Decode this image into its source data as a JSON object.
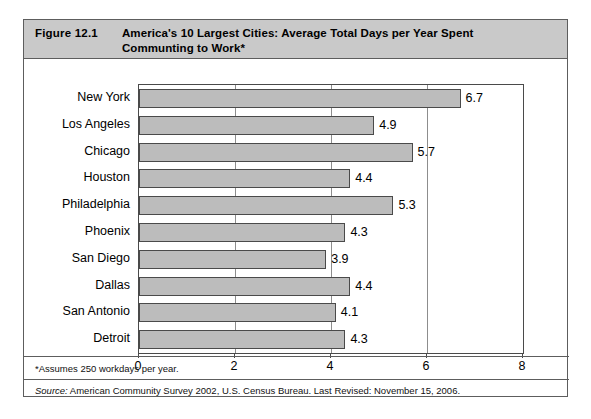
{
  "figure": {
    "number": "Figure 12.1",
    "title": "America's 10 Largest Cities: Average Total Days per Year Spent Communting to Work*",
    "footnote": "*Assumes 250 workdays per year.",
    "source_label": "Source:",
    "source_text": " American Community Survey 2002, U.S. Census Bureau. Last Revised: November 15, 2006."
  },
  "colors": {
    "bar_fill": "#bcbcbc",
    "bar_stroke": "#4a4a4a",
    "header_band": "#c9c9c9",
    "frame": "#5d5d5d",
    "gridline": "#8d8d8d"
  },
  "chart_data": {
    "type": "bar",
    "orientation": "horizontal",
    "title": "America's 10 Largest Cities: Average Total Days per Year Spent Communting to Work*",
    "xlabel": "",
    "ylabel": "",
    "xlim": [
      0,
      8
    ],
    "xticks": [
      0,
      2,
      4,
      6,
      8
    ],
    "xtick_labels": [
      "0",
      "2",
      "4",
      "6",
      "8"
    ],
    "grid": true,
    "gridlines_at": [
      2,
      4,
      6
    ],
    "legend": null,
    "categories": [
      "New York",
      "Los Angeles",
      "Chicago",
      "Houston",
      "Philadelphia",
      "Phoenix",
      "San Diego",
      "Dallas",
      "San Antonio",
      "Detroit"
    ],
    "values": [
      6.7,
      4.9,
      5.7,
      4.4,
      5.3,
      4.3,
      3.9,
      4.4,
      4.1,
      4.3
    ],
    "data_labels": [
      "6.7",
      "4.9",
      "5.7",
      "4.4",
      "5.3",
      "4.3",
      "3.9",
      "4.4",
      "4.1",
      "4.3"
    ]
  }
}
